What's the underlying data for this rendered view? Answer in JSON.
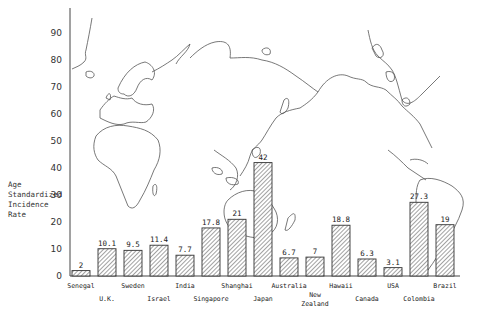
{
  "chart_data": {
    "type": "bar",
    "title": "",
    "xlabel": "",
    "ylabel": "Age Standardized Incidence Rate",
    "ylabel_lines": [
      "Age",
      "Standardized",
      "Incidence",
      "Rate"
    ],
    "ylim": [
      0,
      90
    ],
    "yticks": [
      0,
      10,
      20,
      30,
      40,
      50,
      60,
      70,
      80,
      90
    ],
    "grid": false,
    "legend": null,
    "background": "world map outline (Europe, Africa, Asia, Australia, Americas)",
    "bar_style": "diagonal hatch",
    "categories": [
      "Senegal",
      "U.K.",
      "Sweden",
      "Israel",
      "India",
      "Singapore",
      "Shanghai",
      "Japan",
      "Australia",
      "New Zealand",
      "Hawaii",
      "Canada",
      "USA",
      "Colombia",
      "Brazil"
    ],
    "category_label_rows": [
      0,
      1,
      0,
      1,
      0,
      1,
      0,
      1,
      0,
      1,
      0,
      1,
      0,
      1,
      0
    ],
    "values": [
      2,
      10.1,
      9.5,
      11.4,
      7.7,
      17.8,
      21,
      42,
      6.7,
      7,
      18.8,
      6.3,
      3.1,
      27.3,
      19
    ],
    "value_labels": [
      "2",
      "10.1",
      "9.5",
      "11.4",
      "7.7",
      "17.8",
      "21",
      "42",
      "6.7",
      "7",
      "18.8",
      "6.3",
      "3.1",
      "27.3",
      "19"
    ]
  }
}
